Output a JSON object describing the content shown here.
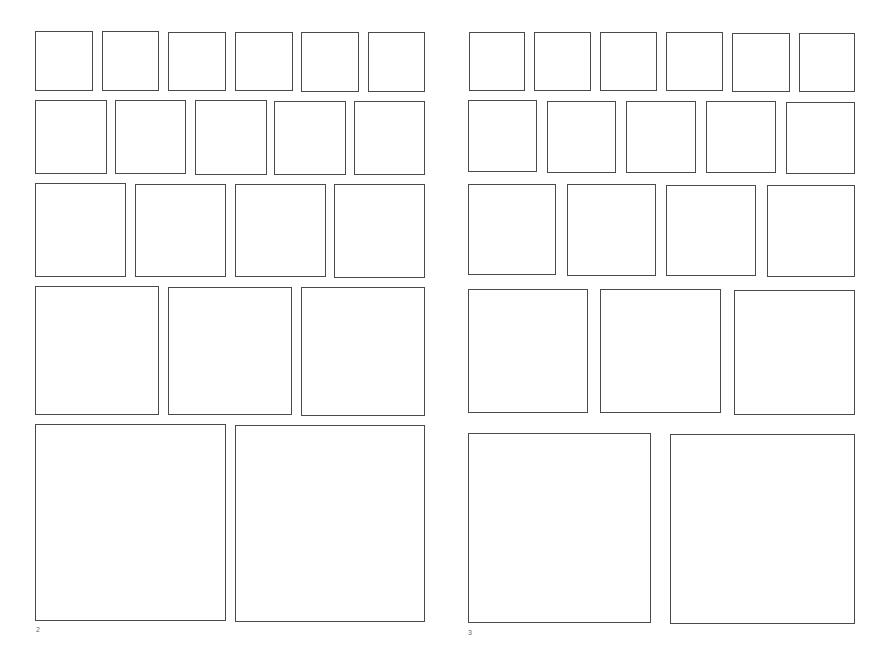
{
  "spread": {
    "pages": [
      {
        "page_number": "2",
        "rows": [
          {
            "count": 6,
            "boxes": [
              [
                35,
                31,
                58,
                60
              ],
              [
                102,
                31,
                57,
                60
              ],
              [
                168,
                32,
                58,
                59
              ],
              [
                235,
                32,
                58,
                59
              ],
              [
                301,
                32,
                58,
                60
              ],
              [
                368,
                32,
                57,
                60
              ]
            ]
          },
          {
            "count": 5,
            "boxes": [
              [
                35,
                100,
                72,
                74
              ],
              [
                115,
                100,
                71,
                74
              ],
              [
                195,
                100,
                72,
                75
              ],
              [
                274,
                101,
                72,
                74
              ],
              [
                354,
                101,
                71,
                74
              ]
            ]
          },
          {
            "count": 4,
            "boxes": [
              [
                35,
                183,
                91,
                94
              ],
              [
                135,
                184,
                91,
                93
              ],
              [
                235,
                184,
                91,
                93
              ],
              [
                334,
                184,
                91,
                94
              ]
            ]
          },
          {
            "count": 3,
            "boxes": [
              [
                35,
                286,
                124,
                129
              ],
              [
                168,
                287,
                124,
                128
              ],
              [
                301,
                287,
                124,
                129
              ]
            ]
          },
          {
            "count": 2,
            "boxes": [
              [
                35,
                424,
                191,
                197
              ],
              [
                235,
                425,
                190,
                197
              ]
            ]
          }
        ],
        "page_number_pos": [
          36,
          626
        ]
      },
      {
        "page_number": "3",
        "rows": [
          {
            "count": 6,
            "boxes": [
              [
                469,
                32,
                56,
                59
              ],
              [
                534,
                32,
                57,
                59
              ],
              [
                600,
                32,
                57,
                59
              ],
              [
                666,
                32,
                57,
                59
              ],
              [
                732,
                33,
                58,
                59
              ],
              [
                799,
                33,
                56,
                59
              ]
            ]
          },
          {
            "count": 5,
            "boxes": [
              [
                468,
                100,
                69,
                72
              ],
              [
                547,
                101,
                69,
                72
              ],
              [
                626,
                101,
                70,
                72
              ],
              [
                706,
                101,
                70,
                72
              ],
              [
                786,
                102,
                69,
                72
              ]
            ]
          },
          {
            "count": 4,
            "boxes": [
              [
                468,
                184,
                88,
                91
              ],
              [
                567,
                184,
                89,
                92
              ],
              [
                666,
                185,
                90,
                91
              ],
              [
                767,
                185,
                88,
                92
              ]
            ]
          },
          {
            "count": 3,
            "boxes": [
              [
                468,
                289,
                120,
                124
              ],
              [
                600,
                289,
                121,
                124
              ],
              [
                734,
                290,
                121,
                125
              ]
            ]
          },
          {
            "count": 2,
            "boxes": [
              [
                468,
                433,
                183,
                190
              ],
              [
                670,
                434,
                185,
                190
              ]
            ]
          }
        ],
        "page_number_pos": [
          468,
          629
        ]
      }
    ]
  }
}
